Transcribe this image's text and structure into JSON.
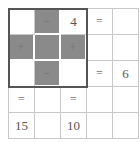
{
  "puzzle": {
    "rows": [
      [
        {
          "value": "",
          "shade": "white"
        },
        {
          "value": "−",
          "shade": "gray"
        },
        {
          "value": "4",
          "shade": "white"
        },
        {
          "value": "=",
          "shade": "white"
        },
        {
          "value": "",
          "shade": "white"
        }
      ],
      [
        {
          "value": "+",
          "shade": "gray"
        },
        {
          "value": "",
          "shade": "gray"
        },
        {
          "value": "+",
          "shade": "gray"
        },
        {
          "value": "",
          "shade": "white"
        },
        {
          "value": "",
          "shade": "white"
        }
      ],
      [
        {
          "value": "",
          "shade": "white"
        },
        {
          "value": "−",
          "shade": "gray"
        },
        {
          "value": "",
          "shade": "white"
        },
        {
          "value": "=",
          "shade": "white"
        },
        {
          "value": "6",
          "shade": "white"
        }
      ],
      [
        {
          "value": "=",
          "shade": "white"
        },
        {
          "value": "",
          "shade": "white"
        },
        {
          "value": "=",
          "shade": "white"
        },
        {
          "value": "",
          "shade": "white"
        },
        {
          "value": "",
          "shade": "white"
        }
      ],
      [
        {
          "value": "15",
          "shade": "white"
        },
        {
          "value": "",
          "shade": "white"
        },
        {
          "value": "10",
          "shade": "white"
        },
        {
          "value": "",
          "shade": "white"
        },
        {
          "value": "",
          "shade": "white"
        }
      ]
    ]
  },
  "colors": {
    "gray_cell": "#8a8a8a",
    "border_thick": "#555555",
    "grid_line": "#c8c8c8"
  }
}
